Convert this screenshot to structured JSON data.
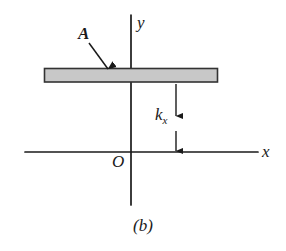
{
  "figure": {
    "caption": "(b)",
    "background_color": "#ffffff",
    "line_color": "#1a1a1a",
    "bar_fill_color": "#c8c8c8",
    "bar_stroke_color": "#333333",
    "labels": {
      "area_label": "A",
      "y_axis": "y",
      "x_axis": "x",
      "origin": "O",
      "distance_symbol": "k",
      "distance_subscript": "x"
    },
    "geometry": {
      "x_axis": {
        "x1": 25,
        "y1": 152,
        "x2": 258,
        "y2": 152
      },
      "y_axis": {
        "x1": 131,
        "y1": 15,
        "x2": 131,
        "y2": 205
      },
      "bar": {
        "x": 44,
        "y": 68,
        "width": 174,
        "height": 14
      },
      "leader_arrow": {
        "x1": 89,
        "y1": 44,
        "x2": 110,
        "y2": 72
      },
      "dimension_arrow": {
        "x": 176,
        "y_top": 84,
        "y_bottom": 151
      }
    }
  }
}
